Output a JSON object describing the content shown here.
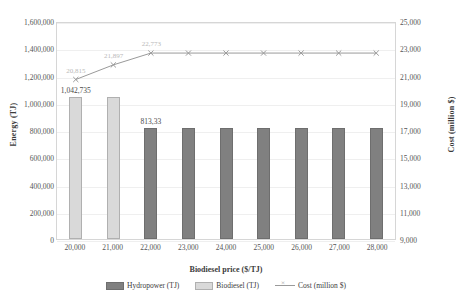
{
  "chart_data": {
    "type": "bar",
    "title": "",
    "xlabel": "Biodiesel price ($/TJ)",
    "ylabel": "Energy (TJ)",
    "y2label": "Cost (million $)",
    "categories": [
      "20,000",
      "21,000",
      "22,000",
      "23,000",
      "24,000",
      "25,000",
      "26,000",
      "27,000",
      "28,000"
    ],
    "x_values": [
      20000,
      21000,
      22000,
      23000,
      24000,
      25000,
      26000,
      27000,
      28000
    ],
    "ylim": [
      0,
      1600000
    ],
    "y2lim": [
      9000,
      25000
    ],
    "yticks": [
      "0",
      "200,000",
      "400,000",
      "600,000",
      "800,000",
      "1,000,000",
      "1,200,000",
      "1,400,000",
      "1,600,000"
    ],
    "ytick_values": [
      0,
      200000,
      400000,
      600000,
      800000,
      1000000,
      1200000,
      1400000,
      1600000
    ],
    "y2ticks": [
      "9,000",
      "11,000",
      "13,000",
      "15,000",
      "17,000",
      "19,000",
      "21,000",
      "23,000",
      "25,000"
    ],
    "y2tick_values": [
      9000,
      11000,
      13000,
      15000,
      17000,
      19000,
      21000,
      23000,
      25000
    ],
    "grid": true,
    "legend_position": "bottom",
    "series": [
      {
        "name": "Hydropower (TJ)",
        "type": "bar",
        "axis": "left",
        "color": "#808080",
        "values": [
          0,
          0,
          813333,
          813333,
          813333,
          813333,
          813333,
          813333,
          813333
        ],
        "labels": [
          "",
          "",
          "813,33",
          "",
          "",
          "",
          "",
          "",
          ""
        ]
      },
      {
        "name": "Biodiesel (TJ)",
        "type": "bar",
        "axis": "left",
        "color": "#D9D9D9",
        "values": [
          1042735,
          1042735,
          0,
          0,
          0,
          0,
          0,
          0,
          0
        ],
        "labels": [
          "1,042,735",
          "",
          "",
          "",
          "",
          "",
          "",
          "",
          ""
        ]
      },
      {
        "name": "Cost (million $)",
        "type": "line",
        "axis": "right",
        "color": "#9A9A9A",
        "marker": "x",
        "values": [
          20815,
          21897,
          22773,
          22773,
          22773,
          22773,
          22773,
          22773,
          22773
        ],
        "labels": [
          "20,815",
          "21,897",
          "22,773",
          "",
          "",
          "",
          "",
          "",
          ""
        ]
      }
    ]
  },
  "legend": {
    "items": [
      {
        "label": "Hydropower (TJ)",
        "swatch": "hydropower"
      },
      {
        "label": "Biodiesel (TJ)",
        "swatch": "biodiesel"
      },
      {
        "label": "Cost (million $)",
        "swatch": "line"
      }
    ]
  },
  "colors": {
    "hydropower": "#808080",
    "biodiesel": "#D9D9D9",
    "cost_line": "#9A9A9A",
    "grid": "#EFEFEF",
    "axis": "#D6D6D6"
  }
}
